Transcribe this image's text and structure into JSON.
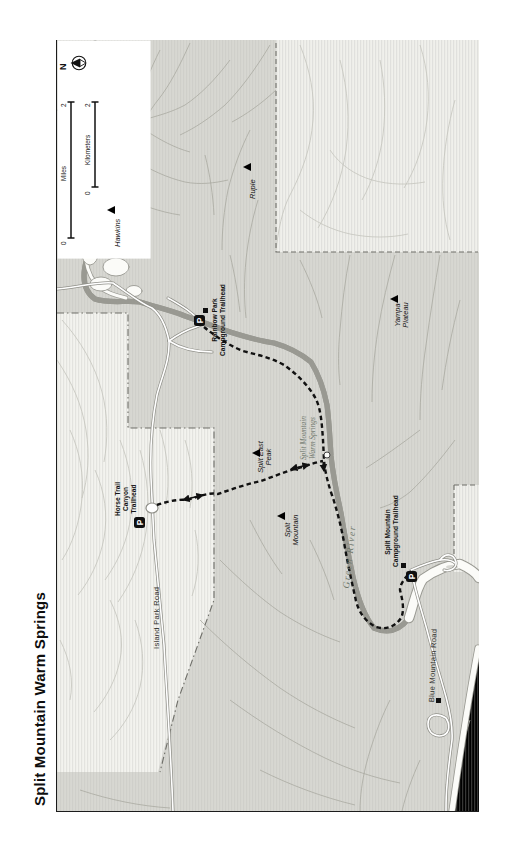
{
  "title": "Split Mountain Warm Springs",
  "compass": {
    "north_label": "N"
  },
  "scalebar": {
    "kilometers": {
      "zero": "0",
      "unit": "Kilometers",
      "max": "2"
    },
    "miles": {
      "zero": "0",
      "unit": "Miles",
      "max": "2"
    }
  },
  "colors": {
    "park_fill": "#d7d7d2",
    "nonpark_fill": "#f0f0ec",
    "contour": "#a9a9a1",
    "river_casing": "#999992",
    "trail": "#111111",
    "boundary": "#6f6f69",
    "feature_text": "#6f776c"
  },
  "map": {
    "parking_glyph": "P",
    "labels": [
      {
        "name": "north-label",
        "type": "north",
        "x": 59,
        "y": 70,
        "rot": -90,
        "lines": [
          "N"
        ]
      },
      {
        "name": "scale-km-zero",
        "type": "scale",
        "x": 84,
        "y": 195,
        "rot": -90,
        "lines": [
          "0"
        ]
      },
      {
        "name": "scale-km-unit",
        "type": "scale",
        "x": 84,
        "y": 165,
        "rot": -90,
        "lines": [
          "Kilometers"
        ]
      },
      {
        "name": "scale-km-max",
        "type": "scale",
        "x": 84,
        "y": 107,
        "rot": -90,
        "lines": [
          "2"
        ]
      },
      {
        "name": "scale-miles-zero",
        "type": "scale",
        "x": 60,
        "y": 245,
        "rot": -90,
        "lines": [
          "0"
        ]
      },
      {
        "name": "scale-miles-unit",
        "type": "scale",
        "x": 60,
        "y": 181,
        "rot": -90,
        "lines": [
          "Miles"
        ]
      },
      {
        "name": "scale-miles-max",
        "type": "scale",
        "x": 60,
        "y": 107,
        "rot": -90,
        "lines": [
          "2"
        ]
      },
      {
        "name": "hawkins-peak-label",
        "type": "peak",
        "x": 114,
        "y": 247,
        "rot": -90,
        "lines": [
          "Hawkins"
        ]
      },
      {
        "name": "ruple-peak-label",
        "type": "peak",
        "x": 249,
        "y": 199,
        "rot": -90,
        "lines": [
          "Ruple"
        ]
      },
      {
        "name": "split-east-peak-label",
        "type": "peak",
        "x": 257,
        "y": 477,
        "rot": -90,
        "w": 40,
        "lines": [
          "Split East",
          "Peak"
        ]
      },
      {
        "name": "split-mountain-peak-label",
        "type": "peak",
        "x": 284,
        "y": 550,
        "rot": -90,
        "w": 40,
        "lines": [
          "Split",
          "Mountain"
        ]
      },
      {
        "name": "yampa-plateau-label",
        "type": "peak",
        "x": 394,
        "y": 334,
        "rot": -90,
        "w": 38,
        "lines": [
          "Yampa",
          "Plateau"
        ]
      },
      {
        "name": "rainbow-park-trailhead-label",
        "type": "th",
        "x": 211,
        "y": 356,
        "rot": -90,
        "w": 72,
        "lines": [
          "Rainbow Park",
          "Campground Trailhead"
        ]
      },
      {
        "name": "horse-trail-canyon-trailhead-label",
        "type": "th",
        "x": 114,
        "y": 523,
        "rot": -90,
        "w": 48,
        "lines": [
          "Horse Trail",
          "Canyon",
          "Trailhead"
        ]
      },
      {
        "name": "split-mountain-campground-trailhead-label",
        "type": "th",
        "x": 384,
        "y": 567,
        "rot": -90,
        "w": 70,
        "lines": [
          "Split Mountain",
          "Campground Trailhead"
        ]
      },
      {
        "name": "island-park-road-label",
        "type": "road",
        "x": 153,
        "y": 649,
        "rot": -90,
        "lines": [
          "Island Park Road"
        ]
      },
      {
        "name": "blue-mountain-road-label",
        "type": "road",
        "x": 428,
        "y": 702,
        "rot": -88,
        "lines": [
          "Blue Mountain Road"
        ]
      },
      {
        "name": "green-river-label",
        "type": "water",
        "x": 341,
        "y": 588,
        "rot": -84,
        "lines": [
          "Green River"
        ]
      },
      {
        "name": "warm-springs-label",
        "type": "water2",
        "x": 299,
        "y": 471,
        "rot": -90,
        "w": 66,
        "lines": [
          "Split Mountain",
          "Warm Springs"
        ]
      }
    ],
    "peaks": [
      {
        "name": "hawkins-peak-marker",
        "x": 107,
        "y": 206
      },
      {
        "name": "ruple-peak-marker",
        "x": 243,
        "y": 163
      },
      {
        "name": "split-east-peak-marker",
        "x": 252,
        "y": 449
      },
      {
        "name": "split-mountain-peak-marker",
        "x": 277,
        "y": 512
      },
      {
        "name": "yampa-plateau-marker",
        "x": 390,
        "y": 295
      }
    ],
    "parking": [
      {
        "name": "rainbow-park-parking",
        "x": 194,
        "y": 315
      },
      {
        "name": "horse-trail-parking",
        "x": 134,
        "y": 517
      },
      {
        "name": "split-mountain-parking",
        "x": 406,
        "y": 571
      }
    ],
    "squares": [
      {
        "name": "rainbow-park-trailhead-marker",
        "x": 203,
        "y": 308
      },
      {
        "name": "split-mountain-trailhead-marker",
        "x": 401,
        "y": 563
      },
      {
        "name": "blue-mountain-road-site-marker",
        "x": 436,
        "y": 698
      }
    ]
  }
}
